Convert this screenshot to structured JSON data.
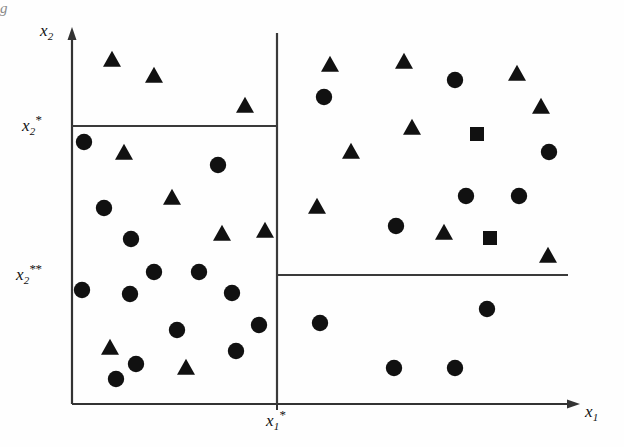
{
  "figure": {
    "title": "",
    "background_color": "#fefefe",
    "ink_color": "#111111",
    "edge_artifact": "g"
  },
  "axes": {
    "x_axis_label": "x",
    "x_axis_sub": "1",
    "y_axis_label": "x",
    "y_axis_sub": "2",
    "x_origin_px": 72,
    "y_origin_px": 404,
    "x_end_px": 578,
    "y_top_px": 30
  },
  "ticks": [
    {
      "name": "x2-star",
      "label": "x",
      "sub": "2",
      "star": "*",
      "axis": "y",
      "pixel": 126
    },
    {
      "name": "x2-2star",
      "label": "x",
      "sub": "2",
      "star": "**",
      "axis": "y",
      "pixel": 275
    },
    {
      "name": "x1-star",
      "label": "x",
      "sub": "1",
      "star": "*",
      "axis": "x",
      "pixel": 277
    }
  ],
  "split_lines": [
    {
      "name": "vertical-split-x1-star",
      "orientation": "vertical",
      "x": 277,
      "y1": 33,
      "y2": 404
    },
    {
      "name": "horizontal-split-x2-star",
      "orientation": "horizontal",
      "y": 126,
      "x1": 72,
      "x2": 277
    },
    {
      "name": "horizontal-split-x2-2star",
      "orientation": "horizontal",
      "y": 275,
      "x1": 277,
      "x2": 568
    }
  ],
  "frame": {
    "left_border": {
      "x": 72,
      "y1": 30,
      "y2": 404
    },
    "bottom_border": {
      "y": 404,
      "x1": 72,
      "x2": 578
    }
  },
  "chart_data": {
    "type": "scatter",
    "title": "",
    "xlabel": "x1",
    "ylabel": "x2",
    "grid": false,
    "legend": "none",
    "xlim": [
      72,
      578
    ],
    "ylim": [
      404,
      30
    ],
    "note": "Coordinates are in screenshot pixel space; y increases downward.",
    "series": [
      {
        "name": "triangle",
        "marker": "triangle",
        "color": "#111111",
        "count": 18,
        "points": [
          [
            112,
            60
          ],
          [
            154,
            76
          ],
          [
            245,
            106
          ],
          [
            124,
            153
          ],
          [
            172,
            198
          ],
          [
            222,
            234
          ],
          [
            265,
            231
          ],
          [
            110,
            348
          ],
          [
            186,
            368
          ],
          [
            404,
            62
          ],
          [
            517,
            74
          ],
          [
            412,
            128
          ],
          [
            351,
            152
          ],
          [
            541,
            107
          ],
          [
            317,
            207
          ],
          [
            444,
            233
          ],
          [
            548,
            256
          ],
          [
            330,
            65
          ]
        ]
      },
      {
        "name": "circle",
        "marker": "circle",
        "color": "#111111",
        "count": 24,
        "points": [
          [
            84,
            142
          ],
          [
            104,
            208
          ],
          [
            131,
            239
          ],
          [
            218,
            165
          ],
          [
            130,
            294
          ],
          [
            116,
            379
          ],
          [
            177,
            330
          ],
          [
            236,
            351
          ],
          [
            82,
            290
          ],
          [
            232,
            293
          ],
          [
            324,
            97
          ],
          [
            455,
            80
          ],
          [
            549,
            152
          ],
          [
            466,
            196
          ],
          [
            519,
            196
          ],
          [
            396,
            226
          ],
          [
            320,
            323
          ],
          [
            487,
            309
          ],
          [
            394,
            368
          ],
          [
            455,
            368
          ],
          [
            154,
            272
          ],
          [
            199,
            272
          ],
          [
            259,
            325
          ],
          [
            136,
            364
          ]
        ]
      },
      {
        "name": "square",
        "marker": "square",
        "color": "#111111",
        "count": 2,
        "points": [
          [
            477,
            134
          ],
          [
            490,
            238
          ]
        ]
      }
    ]
  }
}
